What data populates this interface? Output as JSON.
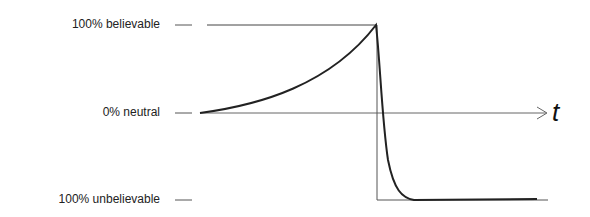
{
  "diagram": {
    "y_levels": [
      {
        "label": "100% believable",
        "value": 100
      },
      {
        "label": "0% neutral",
        "value": 0
      },
      {
        "label": "100% unbelievable",
        "value": -100
      }
    ],
    "x_axis_label": "t",
    "curve": {
      "description": "Belief rises exponentially from neutral to 100% believable, then drops sharply to 100% unbelievable and stays flat",
      "peak_label": "100% believable",
      "floor_label": "100% unbelievable"
    },
    "colors": {
      "line": "#333333",
      "curve": "#222222",
      "text": "#222222"
    }
  }
}
